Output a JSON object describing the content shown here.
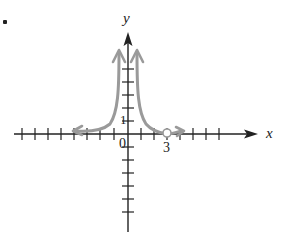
{
  "figure": {
    "bullet": "•",
    "x_axis_label": "x",
    "y_axis_label": "y",
    "origin_label": "0",
    "y_tick_label": "1",
    "x_tick_label": "3"
  },
  "colors": {
    "axis": "#222222",
    "curve": "#9a9a9a",
    "background": "#ffffff"
  },
  "chart_data": {
    "type": "line",
    "title": "",
    "xlabel": "x",
    "ylabel": "y",
    "grid": false,
    "legend": "none",
    "xlim": [
      -8,
      9
    ],
    "ylim": [
      -7,
      7
    ],
    "x_ticks_step": 1,
    "y_ticks_step": 1,
    "labeled_ticks": {
      "x": [
        0,
        3
      ],
      "y": [
        0,
        1
      ]
    },
    "series": [
      {
        "name": "right branch",
        "description": "curve rising toward +infinity near x=0 from right, decaying toward y=0 as x increases, with open circle (hole) at x=3 on the x-axis and arrow continuing right",
        "points": [
          [
            0.3,
            6.0
          ],
          [
            0.5,
            4.0
          ],
          [
            0.8,
            2.0
          ],
          [
            1.2,
            1.0
          ],
          [
            2.0,
            0.35
          ],
          [
            3.0,
            0.0
          ],
          [
            4.0,
            0.15
          ]
        ],
        "open_circle": [
          3,
          0
        ]
      },
      {
        "name": "left branch",
        "description": "mirror image: rising toward +infinity near x=0 from left, decaying toward y=0 as x decreases, arrow continuing left",
        "points": [
          [
            -0.3,
            6.0
          ],
          [
            -0.5,
            4.0
          ],
          [
            -0.8,
            2.0
          ],
          [
            -1.2,
            1.0
          ],
          [
            -2.0,
            0.35
          ],
          [
            -3.0,
            0.1
          ],
          [
            -4.0,
            0.05
          ]
        ]
      }
    ]
  }
}
